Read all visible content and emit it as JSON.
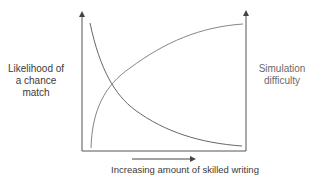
{
  "diagram": {
    "left_axis_label": "Likelihood of a chance match",
    "left_axis_label_lines": [
      "Likelihood of",
      "a chance",
      "match"
    ],
    "right_axis_label": "Simulation difficulty",
    "right_axis_label_lines": [
      "Simulation",
      "difficulty"
    ],
    "x_axis_label": "Increasing amount of skilled writing",
    "curves": [
      {
        "name": "Likelihood of a chance match",
        "trend": "decreasing",
        "color": "#555555"
      },
      {
        "name": "Simulation difficulty",
        "trend": "increasing",
        "color": "#777777"
      }
    ],
    "colors": {
      "axis": "#444444",
      "background": "#ffffff"
    }
  }
}
